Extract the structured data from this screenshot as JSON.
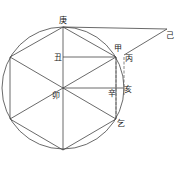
{
  "diagram": {
    "type": "geometric-figure",
    "labels": {
      "top": "庚",
      "upper_right_circle": "甲",
      "right_outer": "丙",
      "far_right": "己",
      "upper_inner": "丑",
      "center": "卯",
      "right_inner": "辛",
      "right_edge": "亥",
      "lower_right": "乞"
    },
    "colors": {
      "line": "#444444",
      "text": "#222222",
      "background": "#ffffff"
    }
  }
}
